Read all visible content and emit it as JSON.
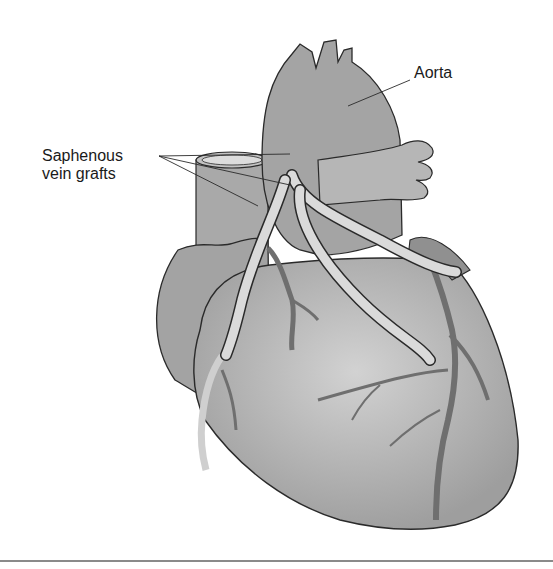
{
  "figure": {
    "labels": {
      "aorta": "Aorta",
      "grafts_line1": "Saphenous",
      "grafts_line2": "vein grafts"
    },
    "colors": {
      "background": "#ffffff",
      "heart_fill": "#b8b8b8",
      "heart_dark": "#8e8e8e",
      "heart_light": "#d4d4d4",
      "vessel_fill": "#9a9a9a",
      "graft_fill": "#d8d8d8",
      "outline": "#2a2a2a",
      "rule": "#8a8a8a"
    }
  }
}
